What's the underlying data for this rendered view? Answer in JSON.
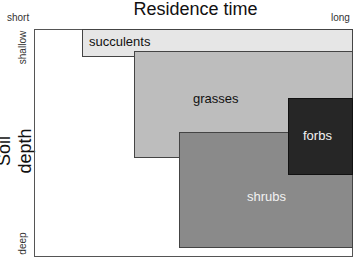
{
  "title": "Residence time",
  "x_axis": {
    "left_label": "short",
    "right_label": "long"
  },
  "y_axis": {
    "label": "Soil depth",
    "top_label": "shallow",
    "bottom_label": "deep"
  },
  "regions": [
    {
      "name": "succulents",
      "color": "#e6e6e6",
      "text_color": "#111111"
    },
    {
      "name": "grasses",
      "color": "#bdbdbd",
      "text_color": "#111111"
    },
    {
      "name": "shrubs",
      "color": "#8a8a8a",
      "text_color": "#f2f2f2"
    },
    {
      "name": "forbs",
      "color": "#262626",
      "text_color": "#f2f2f2"
    }
  ]
}
